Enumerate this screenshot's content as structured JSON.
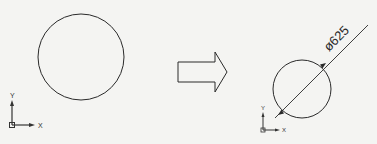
{
  "diagram": {
    "before": {
      "shape": "circle",
      "center": [
        81,
        57
      ],
      "radius": 43,
      "ucs_icon": {
        "x_label": "X",
        "y_label": "Y"
      }
    },
    "transform_arrow": {
      "direction": "right",
      "icon": "block-arrow-right-icon"
    },
    "after": {
      "shape": "circle",
      "center": [
        302,
        89
      ],
      "radius": 29,
      "dimension": {
        "type": "diameter",
        "text": "ø625"
      },
      "ucs_icon": {
        "x_label": "X",
        "y_label": "Y"
      }
    },
    "colors": {
      "line": "#2a2a2a",
      "background": "#f4f4f2"
    }
  }
}
